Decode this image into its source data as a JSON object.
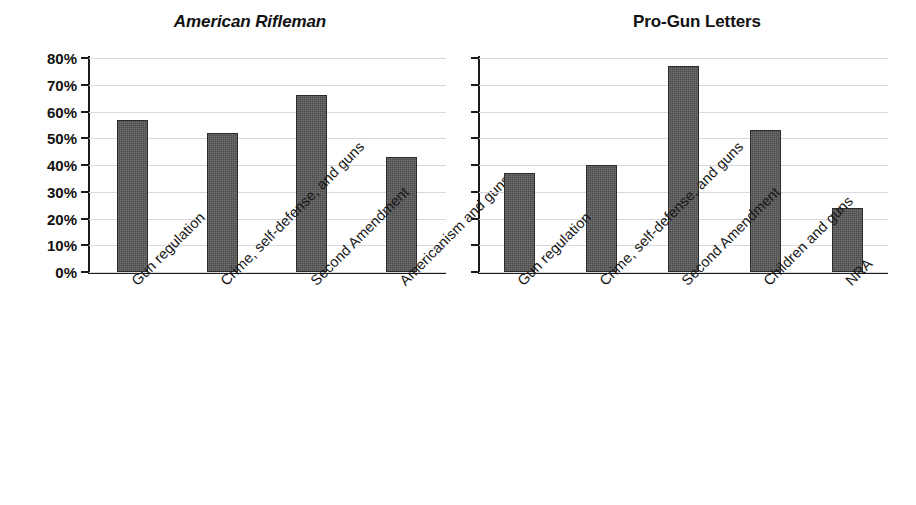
{
  "figure": {
    "background": "#ffffff",
    "bar_color": "#4c4c4c",
    "gridline_color": "#d8d8de",
    "axis_color": "#1b1b1b"
  },
  "charts": [
    {
      "title": "American Rifleman",
      "title_style": "bold-italic",
      "axis": {
        "ylabels": [
          "80%",
          "70%",
          "60%",
          "50%",
          "40%",
          "30%",
          "20%",
          "10%",
          "0%"
        ],
        "ymin": 0,
        "ymax": 80,
        "ystep": 10,
        "show_ylabels": true
      },
      "categories": [
        "Gun regulation",
        "Crime, self-defense, and guns",
        "Second Amendment",
        "Americanism and guns"
      ],
      "values": [
        57,
        52,
        66,
        43
      ]
    },
    {
      "title": "Pro-Gun Letters",
      "title_style": "bold",
      "axis": {
        "ylabels": [],
        "ymin": 0,
        "ymax": 80,
        "ystep": 10,
        "show_ylabels": false
      },
      "categories": [
        "Gun regulation",
        "Crime, self-defense, and guns",
        "Second Amendment",
        "Children and guns",
        "NRA"
      ],
      "values": [
        37,
        40,
        77,
        53,
        24
      ]
    }
  ],
  "chart_data": [
    {
      "type": "bar",
      "title": "American Rifleman",
      "categories": [
        "Gun regulation",
        "Crime, self-defense, and guns",
        "Second Amendment",
        "Americanism and guns"
      ],
      "values": [
        57,
        52,
        66,
        43
      ],
      "xlabel": "",
      "ylabel": "",
      "ylim": [
        0,
        80
      ],
      "ytick_labels": [
        "0%",
        "10%",
        "20%",
        "30%",
        "40%",
        "50%",
        "60%",
        "70%",
        "80%"
      ],
      "grid": true,
      "legend": "none",
      "units": "percent"
    },
    {
      "type": "bar",
      "title": "Pro-Gun Letters",
      "categories": [
        "Gun regulation",
        "Crime, self-defense, and guns",
        "Second Amendment",
        "Children and guns",
        "NRA"
      ],
      "values": [
        37,
        40,
        77,
        53,
        24
      ],
      "xlabel": "",
      "ylabel": "",
      "ylim": [
        0,
        80
      ],
      "ytick_labels": [],
      "grid": true,
      "legend": "none",
      "units": "percent"
    }
  ]
}
